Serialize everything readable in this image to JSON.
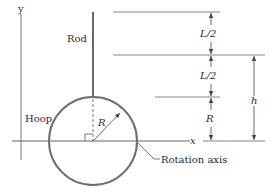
{
  "diagram": {
    "labels": {
      "y_axis": "y",
      "x_axis": "x",
      "rod": "Rod",
      "hoop": "Hoop",
      "radius": "R",
      "rotation_axis": "Rotation axis",
      "dim_upper_half": "L/2",
      "dim_lower_half": "L/2",
      "dim_radius": "R",
      "dim_h": "h"
    },
    "colors": {
      "line": "#6b6b6b",
      "hoop": "#6e6e6e",
      "text": "#2a2a2a",
      "background": "#ffffff"
    }
  }
}
